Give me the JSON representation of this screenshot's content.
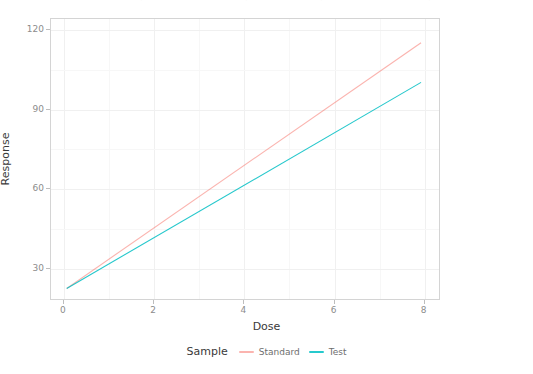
{
  "chart_data": {
    "type": "line",
    "title": "",
    "xlabel": "Dose",
    "ylabel": "Response",
    "xlim": [
      -0.25,
      8.4
    ],
    "ylim": [
      18,
      124
    ],
    "xticks": [
      0,
      2,
      4,
      6,
      8
    ],
    "yticks": [
      30,
      60,
      90,
      120
    ],
    "grid": true,
    "legend_position": "bottom",
    "legend_title": "Sample",
    "series": [
      {
        "name": "Standard",
        "color": "#F8766D",
        "x": [
          0.1,
          8.0
        ],
        "y": [
          22.0,
          115.0
        ]
      },
      {
        "name": "Test",
        "color": "#00BFC4",
        "x": [
          0.1,
          8.0
        ],
        "y": [
          22.0,
          100.0
        ]
      }
    ]
  },
  "axes": {
    "x_title": "Dose",
    "y_title": "Response",
    "x_tick_labels": [
      "0",
      "2",
      "4",
      "6",
      "8"
    ],
    "y_tick_labels": [
      "30",
      "60",
      "90",
      "120"
    ]
  },
  "legend": {
    "title": "Sample",
    "entries": [
      {
        "label": "Standard",
        "color": "#F8766D"
      },
      {
        "label": "Test",
        "color": "#00BFC4"
      }
    ]
  },
  "theme": {
    "panel_background": "#ffffff",
    "panel_border": "#d4d4d4",
    "grid_major": "#f0f0f0",
    "grid_minor": "#f7f7f7",
    "tick_color": "#bdbdbd",
    "tick_label_color": "#8c8c8c",
    "axis_title_color": "#3a3a3a"
  }
}
